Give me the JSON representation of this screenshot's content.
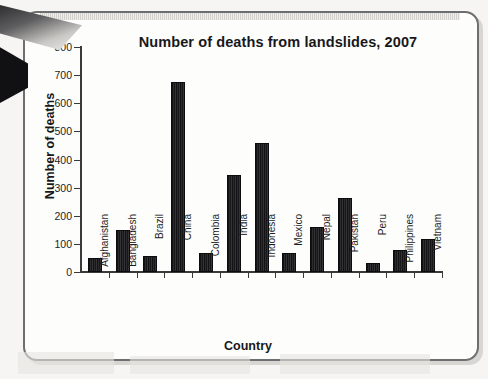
{
  "chart_data": {
    "type": "bar",
    "title": "Number of deaths from landslides, 2007",
    "xlabel": "Country",
    "ylabel": "Number of deaths",
    "categories": [
      "Afghanistan",
      "Bangladesh",
      "Brazil",
      "China",
      "Colombia",
      "India",
      "Indonesia",
      "Mexico",
      "Nepal",
      "Pakistan",
      "Peru",
      "Philippines",
      "Vietnam"
    ],
    "values": [
      50,
      148,
      57,
      675,
      68,
      345,
      459,
      68,
      160,
      263,
      32,
      78,
      117
    ],
    "ylim": [
      0,
      800
    ],
    "ytick_step": 100,
    "ytick_labels": [
      "800",
      "700",
      "600",
      "500",
      "400",
      "300",
      "200",
      "100",
      "0"
    ],
    "ytick_values": [
      800,
      700,
      600,
      500,
      400,
      300,
      200,
      100,
      0
    ],
    "grid": false,
    "legend": false,
    "legend_position": "none",
    "bar_color": "#17171a",
    "axis_color": "#3a3a3c",
    "text_color": "#18181a",
    "page_background": "#fdfdfc",
    "series": [
      {
        "name": "Number of deaths",
        "values": [
          50,
          148,
          57,
          675,
          68,
          345,
          459,
          68,
          160,
          263,
          32,
          78,
          117
        ]
      }
    ]
  }
}
